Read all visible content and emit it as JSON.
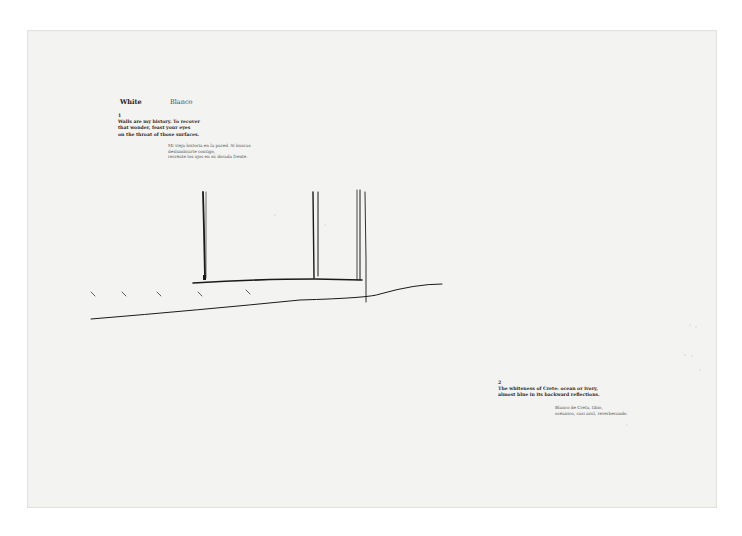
{
  "page": {
    "background_color": "#f3f3f1",
    "ink_color": "#1a1a1a",
    "heading": {
      "english": "White",
      "spanish": "Blanco"
    },
    "entries": [
      {
        "number": "1",
        "english_lines": [
          "Walls are my history. To recover",
          "that wonder, feast your eyes",
          "on the throat of those surfaces."
        ],
        "spanish_lines": [
          "Mi vieja historia en la pared. Si buscas",
          "deslumbrarte contigo,",
          "recréate los ojos en su dorada frente."
        ]
      },
      {
        "number": "2",
        "english_lines": [
          "The whiteness of Crete: ocean or ivory,",
          "almost blue in its backward reflections."
        ],
        "spanish_lines": [
          "Blanco de Creta, tibio,",
          "océanico, casi azul, reverberando."
        ]
      }
    ],
    "sketch": {
      "description": "pen drawing of wall posts on a base line above a sloping ground line with small tick marks"
    }
  }
}
